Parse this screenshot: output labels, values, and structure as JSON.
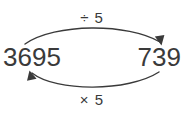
{
  "diagram": {
    "type": "inverse-operations-loop",
    "background_color": "#ffffff",
    "stroke_color": "#3a3a3a",
    "text_color": "#3a3a3a",
    "nodes": {
      "left": {
        "value": "3695",
        "name": "start-value"
      },
      "right": {
        "value": "739",
        "name": "result-value"
      }
    },
    "edges": {
      "forward": {
        "label": "÷ 5",
        "operator": "÷",
        "operand": "5",
        "direction": "left-to-right",
        "position": "top",
        "arrowhead": "right"
      },
      "backward": {
        "label": "× 5",
        "operator": "×",
        "operand": "5",
        "direction": "right-to-left",
        "position": "bottom",
        "arrowhead": "left"
      }
    }
  }
}
